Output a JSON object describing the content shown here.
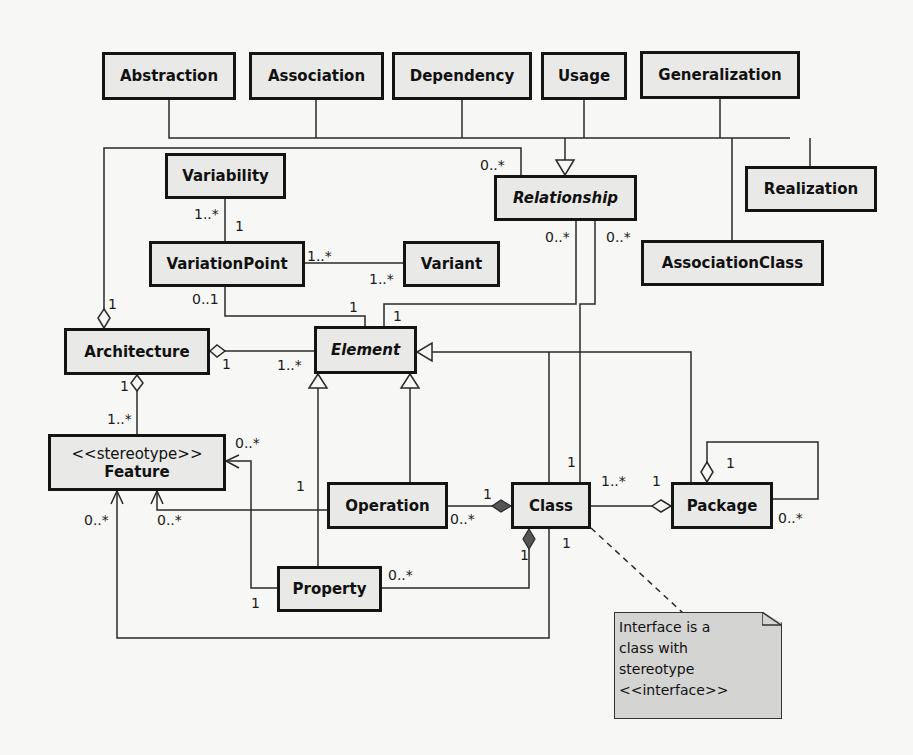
{
  "diagram": {
    "type": "UML class diagram (metamodel)",
    "classes": [
      {
        "id": "abstraction",
        "label": "Abstraction",
        "x": 102,
        "y": 52,
        "w": 134,
        "h": 48
      },
      {
        "id": "association",
        "label": "Association",
        "x": 249,
        "y": 52,
        "w": 135,
        "h": 48
      },
      {
        "id": "dependency",
        "label": "Dependency",
        "x": 392,
        "y": 52,
        "w": 140,
        "h": 48
      },
      {
        "id": "usage",
        "label": "Usage",
        "x": 541,
        "y": 52,
        "w": 86,
        "h": 48
      },
      {
        "id": "generalization",
        "label": "Generalization",
        "x": 640,
        "y": 51,
        "w": 160,
        "h": 48
      },
      {
        "id": "variability",
        "label": "Variability",
        "x": 165,
        "y": 153,
        "w": 121,
        "h": 46
      },
      {
        "id": "relationship",
        "label": "Relationship",
        "x": 494,
        "y": 175,
        "w": 143,
        "h": 46,
        "abstract": true
      },
      {
        "id": "realization",
        "label": "Realization",
        "x": 745,
        "y": 166,
        "w": 132,
        "h": 46
      },
      {
        "id": "variation-point",
        "label": "VariationPoint",
        "x": 149,
        "y": 241,
        "w": 156,
        "h": 46
      },
      {
        "id": "variant",
        "label": "Variant",
        "x": 403,
        "y": 241,
        "w": 97,
        "h": 46
      },
      {
        "id": "association-class",
        "label": "AssociationClass",
        "x": 641,
        "y": 240,
        "w": 183,
        "h": 46
      },
      {
        "id": "architecture",
        "label": "Architecture",
        "x": 64,
        "y": 328,
        "w": 146,
        "h": 47
      },
      {
        "id": "element",
        "label": "Element",
        "x": 314,
        "y": 326,
        "w": 103,
        "h": 48,
        "abstract": true
      },
      {
        "id": "feature",
        "label": "Feature",
        "stereotype": "<<stereotype>>",
        "x": 48,
        "y": 434,
        "w": 178,
        "h": 57
      },
      {
        "id": "operation",
        "label": "Operation",
        "x": 327,
        "y": 482,
        "w": 121,
        "h": 47
      },
      {
        "id": "class",
        "label": "Class",
        "x": 511,
        "y": 482,
        "w": 80,
        "h": 47
      },
      {
        "id": "package",
        "label": "Package",
        "x": 671,
        "y": 482,
        "w": 102,
        "h": 47
      },
      {
        "id": "property",
        "label": "Property",
        "x": 277,
        "y": 566,
        "w": 105,
        "h": 46
      }
    ],
    "multiplicities": [
      {
        "text": "0..*",
        "x": 480,
        "y": 158,
        "for": "relationship-top"
      },
      {
        "text": "1..*",
        "x": 194,
        "y": 207,
        "for": "variability"
      },
      {
        "text": "1",
        "x": 235,
        "y": 219,
        "for": "variation-point-top"
      },
      {
        "text": "1..*",
        "x": 307,
        "y": 249,
        "for": "variation-point-right"
      },
      {
        "text": "1..*",
        "x": 369,
        "y": 272,
        "for": "variant"
      },
      {
        "text": "0..*",
        "x": 545,
        "y": 230,
        "for": "relationship-bottom-left"
      },
      {
        "text": "0..*",
        "x": 606,
        "y": 230,
        "for": "relationship-bottom-right"
      },
      {
        "text": "0..1",
        "x": 192,
        "y": 292,
        "for": "variation-point-bottom"
      },
      {
        "text": "1",
        "x": 349,
        "y": 300,
        "for": "element-top-left"
      },
      {
        "text": "1",
        "x": 393,
        "y": 309,
        "for": "element-top-right"
      },
      {
        "text": "1",
        "x": 108,
        "y": 297,
        "for": "architecture-top"
      },
      {
        "text": "1",
        "x": 222,
        "y": 357,
        "for": "architecture-right"
      },
      {
        "text": "1..*",
        "x": 277,
        "y": 358,
        "for": "element-left"
      },
      {
        "text": "1",
        "x": 120,
        "y": 379,
        "for": "architecture-bottom"
      },
      {
        "text": "1..*",
        "x": 107,
        "y": 412,
        "for": "feature-top"
      },
      {
        "text": "0..*",
        "x": 235,
        "y": 436,
        "for": "feature-right"
      },
      {
        "text": "1",
        "x": 296,
        "y": 479,
        "for": "property-feature"
      },
      {
        "text": "0..*",
        "x": 84,
        "y": 513,
        "for": "feature-bottom-left"
      },
      {
        "text": "0..*",
        "x": 157,
        "y": 513,
        "for": "feature-bottom-right"
      },
      {
        "text": "1",
        "x": 567,
        "y": 455,
        "for": "class-top"
      },
      {
        "text": "1..*",
        "x": 601,
        "y": 474,
        "for": "class-right"
      },
      {
        "text": "1",
        "x": 652,
        "y": 474,
        "for": "package-left"
      },
      {
        "text": "1",
        "x": 726,
        "y": 456,
        "for": "package-self-top"
      },
      {
        "text": "1",
        "x": 483,
        "y": 487,
        "for": "class-operation"
      },
      {
        "text": "0..*",
        "x": 450,
        "y": 512,
        "for": "operation-right"
      },
      {
        "text": "0..*",
        "x": 778,
        "y": 511,
        "for": "package-self-bottom"
      },
      {
        "text": "1",
        "x": 562,
        "y": 536,
        "for": "class-bottom"
      },
      {
        "text": "1",
        "x": 520,
        "y": 548,
        "for": "class-property"
      },
      {
        "text": "0..*",
        "x": 388,
        "y": 568,
        "for": "property-right"
      },
      {
        "text": "1",
        "x": 251,
        "y": 596,
        "for": "property-left"
      }
    ],
    "note": {
      "lines": [
        "Interface is a",
        "class with",
        "stereotype",
        "<<interface>>"
      ],
      "x": 614,
      "y": 612,
      "w": 168,
      "h": 107
    },
    "colors": {
      "background": "#f7f7f5",
      "box_fill": "#e9e9e7",
      "box_border": "#141414",
      "line": "#2a2a2a",
      "composition_fill": "#555555",
      "note_fill": "#d4d4d2"
    }
  }
}
